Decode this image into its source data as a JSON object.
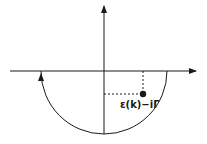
{
  "diagram": {
    "type": "complex-plane-contour",
    "pole_label": "ε(k)−iΓ",
    "colors": {
      "stroke": "#1a1a1a",
      "background": "#ffffff"
    },
    "geometry": {
      "origin": [
        104,
        71
      ],
      "real_axis": {
        "x1": 10,
        "x2": 196
      },
      "imag_axis": {
        "y1": 5,
        "y2": 134
      },
      "contour_radius": 63,
      "pole": [
        143,
        94
      ]
    }
  }
}
